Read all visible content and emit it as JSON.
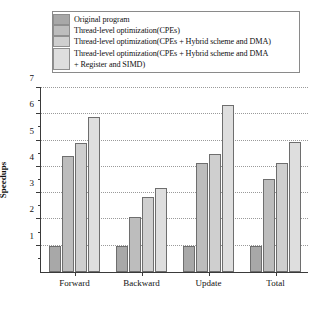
{
  "chart_data": {
    "type": "bar",
    "title": "",
    "xlabel": "",
    "ylabel": "Speedups",
    "ylim": [
      0,
      7
    ],
    "yticks": [
      0,
      1,
      2,
      3,
      4,
      5,
      6,
      7
    ],
    "ytick_labels": [
      "",
      "1",
      "2",
      "3",
      "4",
      "5",
      "6",
      "7"
    ],
    "grid": "horizontal-dotted",
    "legend_position": "top",
    "categories": [
      "Forward",
      "Backward",
      "Update",
      "Total"
    ],
    "series": [
      {
        "name": "Original program",
        "color": "#a8a8a8",
        "values": [
          1.0,
          1.0,
          1.0,
          1.0
        ]
      },
      {
        "name": "Thread-level optimization(CPEs)",
        "color": "#bdbdbd",
        "values": [
          4.4,
          2.1,
          4.15,
          3.55
        ]
      },
      {
        "name": "Thread-level optimization(CPEs + Hybrid scheme and DMA)",
        "color": "#cfcfcf",
        "values": [
          4.9,
          2.85,
          4.5,
          4.15
        ]
      },
      {
        "name": "Thread-level optimization(CPEs + Hybrid scheme and DMA\n+ Register and SIMD)",
        "color": "#dedede",
        "values": [
          5.9,
          3.2,
          6.35,
          4.95
        ]
      }
    ]
  },
  "legend": {
    "items": [
      {
        "label": "Original program",
        "swatch": "#a8a8a8"
      },
      {
        "label": "Thread-level optimization(CPEs)",
        "swatch": "#bdbdbd"
      },
      {
        "label": "Thread-level optimization(CPEs + Hybrid scheme and DMA)",
        "swatch": "#cfcfcf"
      },
      {
        "label": "Thread-level optimization(CPEs + Hybrid scheme and DMA\n+ Register and SIMD)",
        "swatch": "#dedede"
      }
    ]
  },
  "axis": {
    "y_label": "Speedups",
    "y_ticks": [
      "7",
      "6",
      "5",
      "4",
      "3",
      "2",
      "1"
    ],
    "x_labels": [
      "Forward",
      "Backward",
      "Update",
      "Total"
    ]
  }
}
